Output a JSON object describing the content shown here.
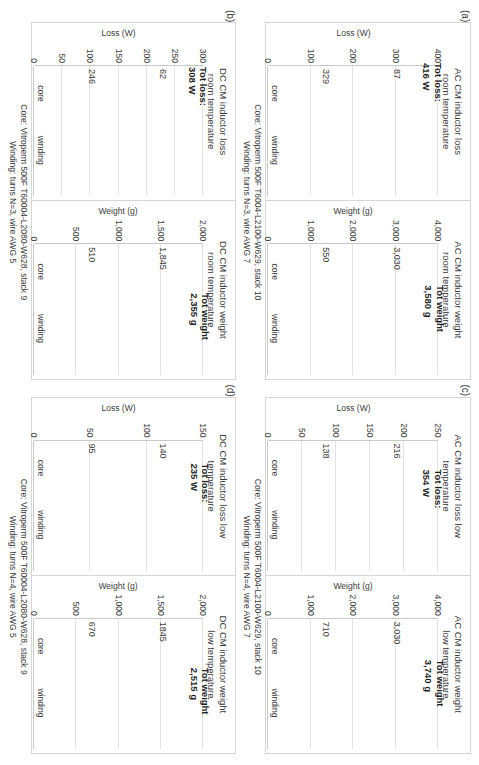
{
  "figure": {
    "bar_color": "#8c8c8c",
    "grid_color": "#e2e2e2",
    "axis_color": "#c9c9c9"
  },
  "panels": [
    {
      "key": "a",
      "label": "(a)",
      "caption_line1": "Core: Vitroperm 500F T6004-L2100-W629, stack 10",
      "caption_line2": "Winding: turns N=3, wire AWG 7",
      "charts": [
        {
          "title": "AC CM inductor loss\nroom temperature",
          "ylabel": "Loss (W)",
          "ticks": [
            "400",
            "300",
            "200",
            "100",
            "0"
          ],
          "tick_values": [
            400,
            300,
            200,
            100,
            0
          ],
          "categories": [
            "core",
            "winding"
          ],
          "values": [
            87,
            329
          ],
          "value_labels": [
            "87",
            "329"
          ],
          "total": "Tot loss:\n416 W"
        },
        {
          "title": "AC CM inductor weight\nroom temperature",
          "ylabel": "Weight (g)",
          "ticks": [
            "4,000",
            "3,000",
            "2,000",
            "1,000",
            "0"
          ],
          "tick_values": [
            4000,
            3000,
            2000,
            1000,
            0
          ],
          "categories": [
            "core",
            "winding"
          ],
          "values": [
            3030,
            550
          ],
          "value_labels": [
            "3,030",
            "550"
          ],
          "total": "Tot weight\n3,580 g"
        }
      ]
    },
    {
      "key": "b",
      "label": "(b)",
      "caption_line1": "Core: Vitroperm 500F T60004-L2080-W628, stack 9",
      "caption_line2": "Winding: turns N=3, wire AWG 5",
      "charts": [
        {
          "title": "DC CM inductor loss\nroom temperature",
          "ylabel": "Loss (W)",
          "ticks": [
            "300",
            "250",
            "200",
            "150",
            "100",
            "50",
            "0"
          ],
          "tick_values": [
            300,
            250,
            200,
            150,
            100,
            50,
            0
          ],
          "categories": [
            "core",
            "winding"
          ],
          "values": [
            62,
            246
          ],
          "value_labels": [
            "62",
            "246"
          ],
          "total": "Tot loss:\n308 W"
        },
        {
          "title": "DC CM inductor weight\nroom temperature",
          "ylabel": "Weight (g)",
          "ticks": [
            "2,000",
            "1,500",
            "1,000",
            "500",
            "0"
          ],
          "tick_values": [
            2000,
            1500,
            1000,
            500,
            0
          ],
          "categories": [
            "core",
            "winding"
          ],
          "values": [
            1845,
            510
          ],
          "value_labels": [
            "1,845",
            "510"
          ],
          "total": "Tot weight\n2,355 g"
        }
      ]
    },
    {
      "key": "c",
      "label": "(c)",
      "caption_line1": "Core: Vitroperm 500F T6004-L2100-W629, stack 10",
      "caption_line2": "Winding: turns N=4, wire AWG 7",
      "charts": [
        {
          "title": "AC CM inductor loss low\ntemperature",
          "ylabel": "Loss (W)",
          "ticks": [
            "250",
            "200",
            "150",
            "100",
            "50",
            "0"
          ],
          "tick_values": [
            250,
            200,
            150,
            100,
            50,
            0
          ],
          "categories": [
            "core",
            "winding"
          ],
          "values": [
            216,
            138
          ],
          "value_labels": [
            "216",
            "138"
          ],
          "total": "Tot loss:\n354 W"
        },
        {
          "title": "AC CM inductor weight\nlow temperature",
          "ylabel": "Weight (g)",
          "ticks": [
            "4,000",
            "3,000",
            "2,000",
            "1,000",
            "0"
          ],
          "tick_values": [
            4000,
            3000,
            2000,
            1000,
            0
          ],
          "categories": [
            "core",
            "winding"
          ],
          "values": [
            3030,
            710
          ],
          "value_labels": [
            "3,030",
            "710"
          ],
          "total": "Tot weight\n3,740 g"
        }
      ]
    },
    {
      "key": "d",
      "label": "(d)",
      "caption_line1": "Core: Vitroperm 500F T60004-L2080-W628, stack 9",
      "caption_line2": "Winding: turns N=4, wire AWG 5",
      "charts": [
        {
          "title": "DC CM inductor loss low\ntemperature",
          "ylabel": "Loss (W)",
          "ticks": [
            "150",
            "100",
            "50",
            "0"
          ],
          "tick_values": [
            150,
            100,
            50,
            0
          ],
          "categories": [
            "core",
            "winding"
          ],
          "values": [
            140,
            95
          ],
          "value_labels": [
            "140",
            "95"
          ],
          "total": "Tot loss:\n235 W"
        },
        {
          "title": "DC CM inductor weight\nlow temperature",
          "ylabel": "Weight (g)",
          "ticks": [
            "2,000",
            "1,500",
            "1,000",
            "500",
            "0"
          ],
          "tick_values": [
            2000,
            1500,
            1000,
            500,
            0
          ],
          "categories": [
            "core",
            "winding"
          ],
          "values": [
            1845,
            670
          ],
          "value_labels": [
            "1845",
            "670"
          ],
          "total": "Tot weight\n2,515 g"
        }
      ]
    }
  ],
  "chart_data": [
    {
      "type": "bar",
      "panel": "(a)",
      "title": "AC CM inductor loss room temperature",
      "categories": [
        "core",
        "winding"
      ],
      "values": [
        87,
        329
      ],
      "xlabel": "",
      "ylabel": "Loss (W)",
      "ylim": [
        0,
        400
      ],
      "yticks": [
        0,
        100,
        200,
        300,
        400
      ],
      "annotation": "Tot loss: 416 W",
      "grid": true,
      "legend": "none",
      "notes": "Core: Vitroperm 500F T6004-L2100-W629, stack 10; Winding: turns N=3, wire AWG 7"
    },
    {
      "type": "bar",
      "panel": "(a)",
      "title": "AC CM inductor weight room temperature",
      "categories": [
        "core",
        "winding"
      ],
      "values": [
        3030,
        550
      ],
      "xlabel": "",
      "ylabel": "Weight (g)",
      "ylim": [
        0,
        4000
      ],
      "yticks": [
        0,
        1000,
        2000,
        3000,
        4000
      ],
      "annotation": "Tot weight 3,580 g",
      "grid": true,
      "legend": "none"
    },
    {
      "type": "bar",
      "panel": "(b)",
      "title": "DC CM inductor loss room temperature",
      "categories": [
        "core",
        "winding"
      ],
      "values": [
        62,
        246
      ],
      "xlabel": "",
      "ylabel": "Loss (W)",
      "ylim": [
        0,
        300
      ],
      "yticks": [
        0,
        50,
        100,
        150,
        200,
        250,
        300
      ],
      "annotation": "Tot loss: 308 W",
      "grid": true,
      "legend": "none",
      "notes": "Core: Vitroperm 500F T60004-L2080-W628, stack 9; Winding: turns N=3, wire AWG 5"
    },
    {
      "type": "bar",
      "panel": "(b)",
      "title": "DC CM inductor weight room temperature",
      "categories": [
        "core",
        "winding"
      ],
      "values": [
        1845,
        510
      ],
      "xlabel": "",
      "ylabel": "Weight (g)",
      "ylim": [
        0,
        2000
      ],
      "yticks": [
        0,
        500,
        1000,
        1500,
        2000
      ],
      "annotation": "Tot weight 2,355 g",
      "grid": true,
      "legend": "none"
    },
    {
      "type": "bar",
      "panel": "(c)",
      "title": "AC CM inductor loss low temperature",
      "categories": [
        "core",
        "winding"
      ],
      "values": [
        216,
        138
      ],
      "xlabel": "",
      "ylabel": "Loss (W)",
      "ylim": [
        0,
        250
      ],
      "yticks": [
        0,
        50,
        100,
        150,
        200,
        250
      ],
      "annotation": "Tot loss: 354 W",
      "grid": true,
      "legend": "none",
      "notes": "Core: Vitroperm 500F T6004-L2100-W629, stack 10; Winding: turns N=4, wire AWG 7"
    },
    {
      "type": "bar",
      "panel": "(c)",
      "title": "AC CM inductor weight low temperature",
      "categories": [
        "core",
        "winding"
      ],
      "values": [
        3030,
        710
      ],
      "xlabel": "",
      "ylabel": "Weight (g)",
      "ylim": [
        0,
        4000
      ],
      "yticks": [
        0,
        1000,
        2000,
        3000,
        4000
      ],
      "annotation": "Tot weight 3,740 g",
      "grid": true,
      "legend": "none"
    },
    {
      "type": "bar",
      "panel": "(d)",
      "title": "DC CM inductor loss low temperature",
      "categories": [
        "core",
        "winding"
      ],
      "values": [
        140,
        95
      ],
      "xlabel": "",
      "ylabel": "Loss (W)",
      "ylim": [
        0,
        150
      ],
      "yticks": [
        0,
        50,
        100,
        150
      ],
      "annotation": "Tot loss: 235 W",
      "grid": true,
      "legend": "none",
      "notes": "Core: Vitroperm 500F T60004-L2080-W628, stack 9; Winding: turns N=4, wire AWG 5"
    },
    {
      "type": "bar",
      "panel": "(d)",
      "title": "DC CM inductor weight low temperature",
      "categories": [
        "core",
        "winding"
      ],
      "values": [
        1845,
        670
      ],
      "xlabel": "",
      "ylabel": "Weight (g)",
      "ylim": [
        0,
        2000
      ],
      "yticks": [
        0,
        500,
        1000,
        1500,
        2000
      ],
      "annotation": "Tot weight 2,515 g",
      "grid": true,
      "legend": "none"
    }
  ]
}
